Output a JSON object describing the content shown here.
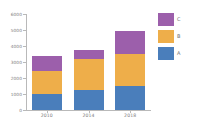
{
  "chart_data": {
    "type": "bar",
    "subtype": "stacked-vertical",
    "title": "",
    "xlabel": "",
    "ylabel": "",
    "categories": [
      "2010",
      "2014",
      "2018"
    ],
    "series": [
      {
        "name": "A",
        "color": "#4a7ebb",
        "values": [
          1000,
          1250,
          1500
        ]
      },
      {
        "name": "B",
        "color": "#eeae4a",
        "values": [
          1450,
          1950,
          2000
        ]
      },
      {
        "name": "C",
        "color": "#9c5fab",
        "values": [
          950,
          550,
          1450
        ]
      }
    ],
    "totals": [
      3400,
      3750,
      4950
    ],
    "ylim": [
      0,
      6000
    ],
    "yticks": [
      0,
      1000,
      2000,
      3000,
      4000,
      5000,
      6000
    ],
    "ytick_labels": [
      "0",
      "1000",
      "2000",
      "3000",
      "4000",
      "5000",
      "6000"
    ],
    "xtick_labels": [
      "2010",
      "2014",
      "2018"
    ],
    "grid": false,
    "legend_position": "right",
    "legend_order": [
      "C",
      "B",
      "A"
    ],
    "background": "#ffffff",
    "axis_color": "#b9b9b9",
    "tick_label_color": "#7d7d7d"
  },
  "legend": {
    "entries": [
      {
        "label": "C",
        "color": "#9c5fab"
      },
      {
        "label": "B",
        "color": "#eeae4a"
      },
      {
        "label": "A",
        "color": "#4a7ebb"
      }
    ]
  }
}
